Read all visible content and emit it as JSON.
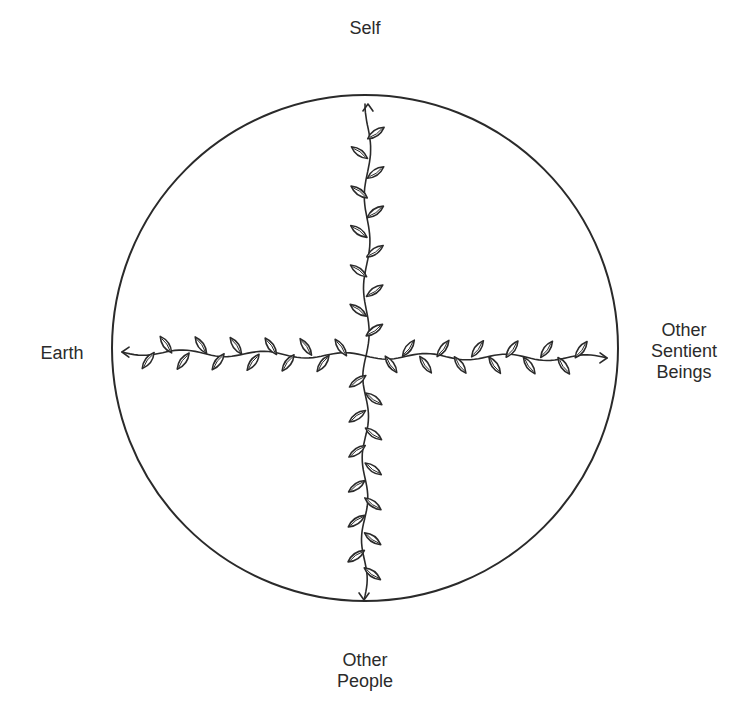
{
  "diagram": {
    "type": "relational-circle",
    "circle": {
      "cx": 365,
      "cy": 348,
      "r": 253
    },
    "center": {
      "x": 366,
      "y": 356
    },
    "stroke_color": "#2a2a2a",
    "labels": {
      "top": "Self",
      "left": "Earth",
      "right_line1": "Other",
      "right_line2": "Sentient",
      "right_line3": "Beings",
      "bottom_line1": "Other",
      "bottom_line2": "People"
    },
    "vines": [
      {
        "name": "vine-to-self",
        "from": [
          366,
          356
        ],
        "to": [
          368,
          104
        ],
        "leaves": 11
      },
      {
        "name": "vine-to-other-people",
        "from": [
          366,
          356
        ],
        "to": [
          364,
          600
        ],
        "leaves": 12
      },
      {
        "name": "vine-to-earth",
        "from": [
          366,
          356
        ],
        "to": [
          122,
          352
        ],
        "leaves": 12
      },
      {
        "name": "vine-to-other-sentient-beings",
        "from": [
          366,
          356
        ],
        "to": [
          607,
          358
        ],
        "leaves": 12
      }
    ]
  }
}
